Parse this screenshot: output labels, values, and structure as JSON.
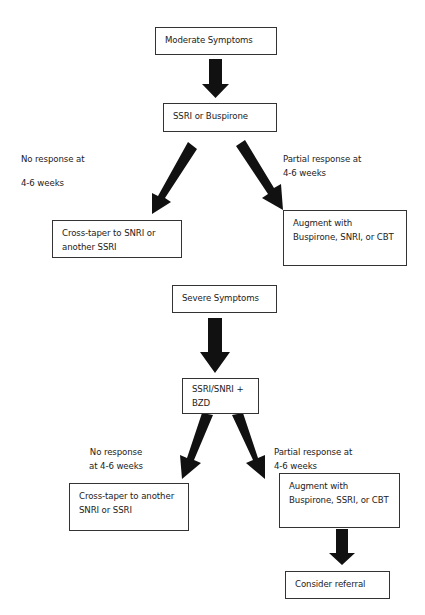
{
  "flowchart": {
    "moderate": {
      "start": "Moderate Symptoms",
      "first_line": "SSRI or Buspirone",
      "no_response_label_line1": "No response at",
      "no_response_label_line2": "4-6 weeks",
      "partial_response_label_line1": "Partial response at",
      "partial_response_label_line2": "4-6 weeks",
      "no_response_action_line1": "Cross-taper to SNRI or",
      "no_response_action_line2": "another SSRI",
      "partial_response_action_line1": "Augment with",
      "partial_response_action_line2": "Buspirone, SNRI, or CBT"
    },
    "severe": {
      "start": "Severe Symptoms",
      "first_line_line1": "SSRI/SNRI +",
      "first_line_line2": "BZD",
      "no_response_label_line1": "No response",
      "no_response_label_line2": "at 4-6 weeks",
      "partial_response_label_line1": "Partial response at",
      "partial_response_label_line2": "4-6 weeks",
      "no_response_action_line1": "Cross-taper to another",
      "no_response_action_line2": "SNRI or SSRI",
      "partial_response_action_line1": "Augment with",
      "partial_response_action_line2": "Buspirone, SSRI, or CBT",
      "final_step": "Consider referral"
    }
  },
  "colors": {
    "arrow": "#111111",
    "box_border": "#333333",
    "text": "#222222"
  }
}
